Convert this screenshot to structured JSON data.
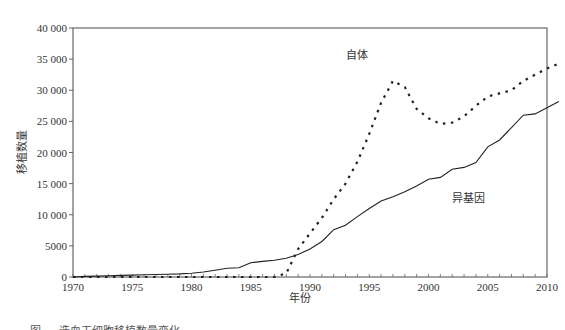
{
  "chart_data": {
    "type": "line",
    "title": "",
    "xlabel": "年份",
    "ylabel": "移植数量",
    "xlim": [
      1970,
      2010
    ],
    "ylim": [
      0,
      40000
    ],
    "x_ticks": [
      "1970",
      "1975",
      "1980",
      "1985",
      "1990",
      "1995",
      "2000",
      "2005",
      "2010"
    ],
    "y_ticks": [
      "0",
      "5000",
      "10 000",
      "15 000",
      "20 000",
      "25 000",
      "30 000",
      "35 000",
      "40 000"
    ],
    "grid": false,
    "legend": "inline labels",
    "x": [
      1970,
      1971,
      1972,
      1973,
      1974,
      1975,
      1976,
      1977,
      1978,
      1979,
      1980,
      1981,
      1982,
      1983,
      1984,
      1985,
      1986,
      1987,
      1988,
      1989,
      1990,
      1991,
      1992,
      1993,
      1994,
      1995,
      1996,
      1997,
      1998,
      1999,
      2000,
      2001,
      2002,
      2003,
      2004,
      2005,
      2006,
      2007,
      2008,
      2009,
      2010,
      2011
    ],
    "series": [
      {
        "name": "自体",
        "style": "dotted",
        "values": [
          0,
          0,
          0,
          0,
          0,
          0,
          0,
          0,
          0,
          0,
          0,
          0,
          0,
          0,
          0,
          0,
          0,
          0,
          600,
          4500,
          7000,
          9500,
          12500,
          15000,
          18500,
          23000,
          28000,
          31500,
          30500,
          27000,
          25500,
          24600,
          24800,
          25800,
          27500,
          29000,
          29500,
          30000,
          31500,
          32500,
          33500,
          34300
        ]
      },
      {
        "name": "异基因",
        "style": "solid",
        "values": [
          0,
          100,
          150,
          200,
          250,
          300,
          350,
          400,
          450,
          500,
          600,
          800,
          1100,
          1400,
          1500,
          2300,
          2500,
          2700,
          3000,
          3600,
          4500,
          5700,
          7600,
          8300,
          9700,
          11000,
          12200,
          12900,
          13700,
          14600,
          15700,
          16000,
          17300,
          17600,
          18400,
          20900,
          22000,
          24000,
          26000,
          26200,
          27200,
          28200
        ]
      }
    ],
    "annotations": [
      {
        "text": "自体",
        "x": 1993,
        "y": 35000
      },
      {
        "text": "异基因",
        "x": 2002,
        "y": 12000
      }
    ]
  },
  "caption": "图 — 造血干细胞移植数量变化"
}
